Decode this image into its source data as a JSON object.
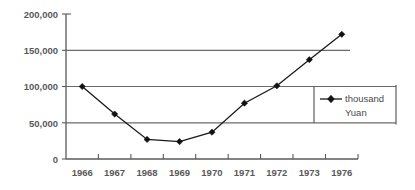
{
  "chart_data": {
    "type": "line",
    "title": "",
    "xlabel": "",
    "ylabel": "",
    "categories": [
      "1966",
      "1967",
      "1968",
      "1969",
      "1970",
      "1971",
      "1972",
      "1973",
      "1976"
    ],
    "values": [
      100000,
      62000,
      27000,
      24000,
      37000,
      77000,
      101000,
      137000,
      172000
    ],
    "series": [
      {
        "name": "thousand Yuan",
        "values": [
          100000,
          62000,
          27000,
          24000,
          37000,
          77000,
          101000,
          137000,
          172000
        ]
      }
    ],
    "ylim": [
      0,
      200000
    ],
    "ytick_labels": [
      "0",
      "50,000",
      "100,000",
      "150,000",
      "200,000"
    ],
    "ytick_values": [
      0,
      50000,
      100000,
      150000,
      200000
    ],
    "grid": true,
    "gridlines_at": [
      50000,
      100000,
      150000
    ],
    "legend_position": "right",
    "legend_entries": [
      "thousand",
      "Yuan"
    ],
    "marker": "diamond",
    "colors": {
      "series": "#111111",
      "gridline": "#6b6b6b",
      "axis": "#5a5a5a",
      "text": "#595959",
      "background": "#ffffff"
    }
  },
  "axes": {
    "y_labels": [
      {
        "text": "200,000"
      },
      {
        "text": "150,000"
      },
      {
        "text": "100,000"
      },
      {
        "text": "50,000"
      },
      {
        "text": "0"
      }
    ],
    "x_labels": [
      {
        "text": "1966"
      },
      {
        "text": "1967"
      },
      {
        "text": "1968"
      },
      {
        "text": "1969"
      },
      {
        "text": "1970"
      },
      {
        "text": "1971"
      },
      {
        "text": "1972"
      },
      {
        "text": "1973"
      },
      {
        "text": "1976"
      }
    ]
  },
  "legend": {
    "line1": "thousand",
    "line2": "Yuan"
  }
}
